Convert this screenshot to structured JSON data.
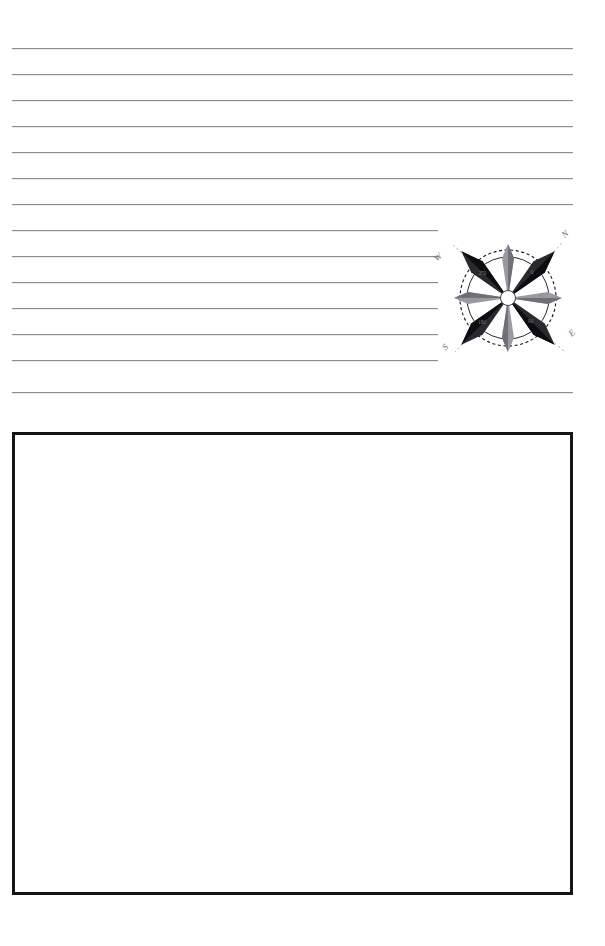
{
  "page": {
    "background_color": "#ffffff",
    "width": 605,
    "height": 946
  },
  "ruled_area": {
    "name": "writing-lines",
    "line_color": "#8c8c91",
    "line_count": 14,
    "left_margin": 12,
    "right_margin": 573,
    "first_line_y": 48,
    "line_spacing": 26,
    "lines": [
      {
        "index": 1,
        "y": 48,
        "x_start": 12,
        "x_end": 573,
        "truncated": false
      },
      {
        "index": 2,
        "y": 74,
        "x_start": 12,
        "x_end": 573,
        "truncated": false
      },
      {
        "index": 3,
        "y": 100,
        "x_start": 12,
        "x_end": 573,
        "truncated": false
      },
      {
        "index": 4,
        "y": 126,
        "x_start": 12,
        "x_end": 573,
        "truncated": false
      },
      {
        "index": 5,
        "y": 152,
        "x_start": 12,
        "x_end": 573,
        "truncated": false
      },
      {
        "index": 6,
        "y": 178,
        "x_start": 12,
        "x_end": 573,
        "truncated": false
      },
      {
        "index": 7,
        "y": 204,
        "x_start": 12,
        "x_end": 573,
        "truncated": false
      },
      {
        "index": 8,
        "y": 230,
        "x_start": 12,
        "x_end": 438,
        "truncated": true
      },
      {
        "index": 9,
        "y": 256,
        "x_start": 12,
        "x_end": 438,
        "truncated": true
      },
      {
        "index": 10,
        "y": 282,
        "x_start": 12,
        "x_end": 438,
        "truncated": true
      },
      {
        "index": 11,
        "y": 308,
        "x_start": 12,
        "x_end": 438,
        "truncated": true
      },
      {
        "index": 12,
        "y": 334,
        "x_start": 12,
        "x_end": 438,
        "truncated": true
      },
      {
        "index": 13,
        "y": 360,
        "x_start": 12,
        "x_end": 438,
        "truncated": true
      },
      {
        "index": 14,
        "y": 392,
        "x_start": 12,
        "x_end": 573,
        "truncated": false
      }
    ]
  },
  "compass": {
    "name": "compass-rose",
    "center_x": 508,
    "center_y": 298,
    "rotation_degrees": 45,
    "outer_dashed_radius": 48,
    "inner_solid_radius": 41,
    "hub_radius": 7,
    "major_point_color": "#111111",
    "minor_point_color": "#8e8e93",
    "ring_color": "#1a1a1a",
    "label_color": "#6e6e73",
    "cardinal_labels": [
      {
        "abbr": "N",
        "position": "top-right",
        "label_x": 143,
        "label_y": 17
      },
      {
        "abbr": "E",
        "position": "bottom-right",
        "label_x": 150,
        "label_y": 116
      },
      {
        "abbr": "S",
        "position": "bottom-left",
        "label_x": 21,
        "label_y": 128
      },
      {
        "abbr": "W",
        "position": "top-left",
        "label_x": 12,
        "label_y": 40
      }
    ],
    "degree_marks": [
      "0",
      "45",
      "90",
      "135",
      "180",
      "225",
      "270",
      "315"
    ]
  },
  "answer_box": {
    "name": "drawing-box",
    "x": 12,
    "y": 432,
    "width": 561,
    "height": 463,
    "border_color": "#151515",
    "border_width": 3.5,
    "fill_color": "#ffffff",
    "content": ""
  }
}
